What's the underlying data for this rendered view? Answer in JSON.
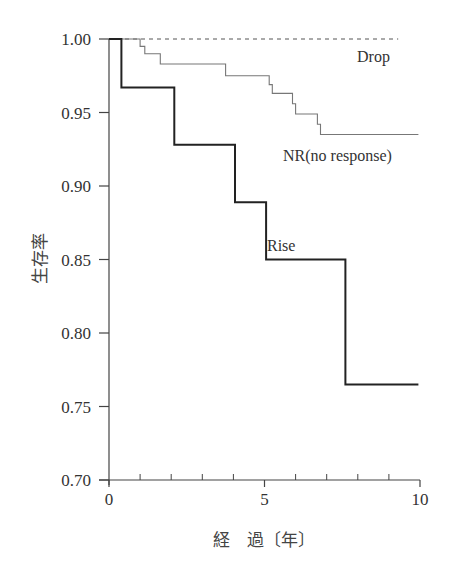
{
  "chart_data": {
    "type": "line",
    "subtype": "step (Kaplan-Meier survival curve)",
    "title": "",
    "xlabel": "経　過〔年〕",
    "ylabel": "生存率",
    "xlim": [
      0,
      10
    ],
    "ylim": [
      0.7,
      1.0
    ],
    "x_ticks": [
      0,
      5,
      10
    ],
    "x_tick_labels": [
      "0",
      "5",
      "10"
    ],
    "x_minor_ticks": [
      1,
      2,
      3,
      4,
      6,
      7,
      8,
      9
    ],
    "y_ticks": [
      0.7,
      0.75,
      0.8,
      0.85,
      0.9,
      0.95,
      1.0
    ],
    "y_tick_labels": [
      "0.70",
      "0.75",
      "0.80",
      "0.85",
      "0.90",
      "0.95",
      "1.00"
    ],
    "grid": false,
    "legend": "inline labels near curves",
    "series": [
      {
        "name": "Drop",
        "style": "dashed",
        "color": "#555555",
        "x": [
          0,
          9.3
        ],
        "y": [
          1.0,
          1.0
        ]
      },
      {
        "name": "NR(no response)",
        "style": "solid-thin",
        "color": "#777777",
        "x": [
          0,
          1.0,
          1.0,
          1.15,
          1.15,
          1.65,
          1.65,
          3.75,
          3.75,
          5.15,
          5.15,
          5.25,
          5.25,
          5.9,
          5.9,
          6.0,
          6.0,
          6.7,
          6.7,
          6.8,
          6.8,
          9.95
        ],
        "y": [
          1.0,
          1.0,
          0.995,
          0.995,
          0.99,
          0.99,
          0.983,
          0.983,
          0.975,
          0.975,
          0.969,
          0.969,
          0.963,
          0.963,
          0.956,
          0.956,
          0.949,
          0.949,
          0.942,
          0.942,
          0.935,
          0.935
        ]
      },
      {
        "name": "Rise",
        "style": "solid-thick",
        "color": "#222222",
        "x": [
          0,
          0.4,
          0.4,
          2.1,
          2.1,
          4.05,
          4.05,
          5.05,
          5.05,
          7.6,
          7.6,
          9.95
        ],
        "y": [
          1.0,
          1.0,
          0.967,
          0.967,
          0.928,
          0.928,
          0.889,
          0.889,
          0.85,
          0.85,
          0.765,
          0.765
        ]
      }
    ],
    "annotations": [
      {
        "text": "Drop",
        "x": 8.1,
        "y": 0.989
      },
      {
        "text": "NR(no response)",
        "x": 6.3,
        "y": 0.92
      },
      {
        "text": "Rise",
        "x": 5.2,
        "y": 0.857
      }
    ]
  },
  "labels": {
    "xlabel": "経　過〔年〕",
    "ylabel": "生存率",
    "drop": "Drop",
    "nr": "NR(no response)",
    "rise": "Rise"
  }
}
